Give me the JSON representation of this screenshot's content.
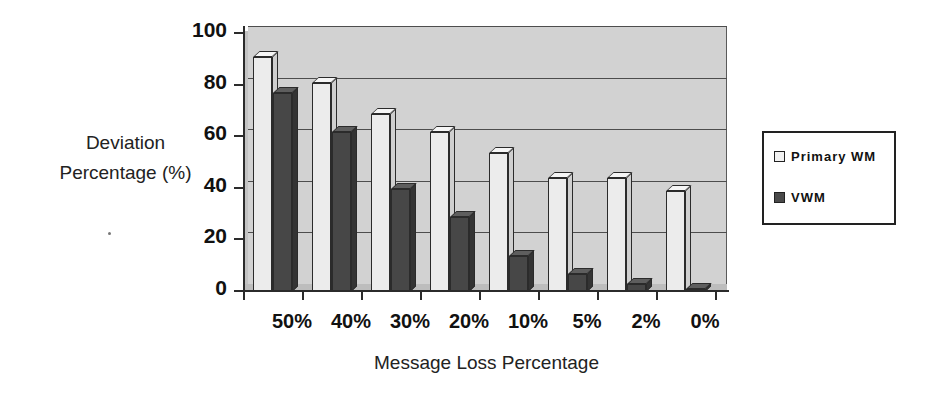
{
  "chart_data": {
    "type": "bar",
    "title": "",
    "xlabel": "Message Loss Percentage",
    "ylabel": "Deviation Percentage (%)",
    "ylabel_lines": [
      "Deviation",
      "Percentage (%)"
    ],
    "categories": [
      "50%",
      "40%",
      "30%",
      "20%",
      "10%",
      "5%",
      "2%",
      "0%"
    ],
    "series": [
      {
        "name": "Primary WM",
        "color": "#ececec",
        "values": [
          91,
          81,
          69,
          62,
          54,
          44,
          44,
          39
        ]
      },
      {
        "name": "VWM",
        "color": "#474747",
        "values": [
          77,
          62,
          40,
          29,
          14,
          7,
          3,
          1
        ]
      }
    ],
    "ylim": [
      0,
      100
    ],
    "yticks": [
      0,
      20,
      40,
      60,
      80,
      100
    ],
    "ytick_labels": [
      "0",
      "20",
      "40",
      "60",
      "80",
      "100"
    ],
    "grid": true,
    "grid_axis": "y",
    "legend_position": "right",
    "style": "3d-column",
    "plot_background": "#d2d2d2",
    "axis_color": "#2b2b2b",
    "page_background": "#ffffff"
  },
  "legend": {
    "items": [
      {
        "label": "Primary WM",
        "swatch": "light"
      },
      {
        "label": "VWM",
        "swatch": "dark"
      }
    ]
  }
}
